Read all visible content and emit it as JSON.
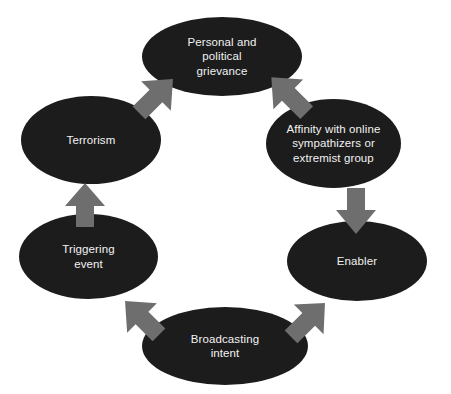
{
  "diagram": {
    "type": "cycle",
    "background_color": "#ffffff",
    "node_fill_color": "#1c1c1c",
    "node_text_color": "#f2f2f2",
    "arrow_color": "#6e6e6e",
    "nodes": [
      {
        "id": "grievance",
        "label": "Personal and\npolitical\ngrievance"
      },
      {
        "id": "affinity",
        "label": "Affinity with online\nsympathizers or\nextremist group"
      },
      {
        "id": "enabler",
        "label": "Enabler"
      },
      {
        "id": "broadcast",
        "label": "Broadcasting\nintent"
      },
      {
        "id": "triggering",
        "label": "Triggering\nevent"
      },
      {
        "id": "terrorism",
        "label": "Terrorism"
      }
    ],
    "arrows": [
      {
        "id": "grievance-affinity",
        "from": "grievance",
        "to": "affinity",
        "direction": "down-right"
      },
      {
        "id": "affinity-enabler",
        "from": "affinity",
        "to": "enabler",
        "direction": "down"
      },
      {
        "id": "enabler-broadcast",
        "from": "enabler",
        "to": "broadcast",
        "direction": "down-left"
      },
      {
        "id": "broadcast-trigger",
        "from": "broadcast",
        "to": "triggering",
        "direction": "up-left"
      },
      {
        "id": "trigger-terrorism",
        "from": "triggering",
        "to": "terrorism",
        "direction": "up"
      },
      {
        "id": "terrorism-grievance",
        "from": "terrorism",
        "to": "grievance",
        "direction": "up-right"
      }
    ]
  }
}
